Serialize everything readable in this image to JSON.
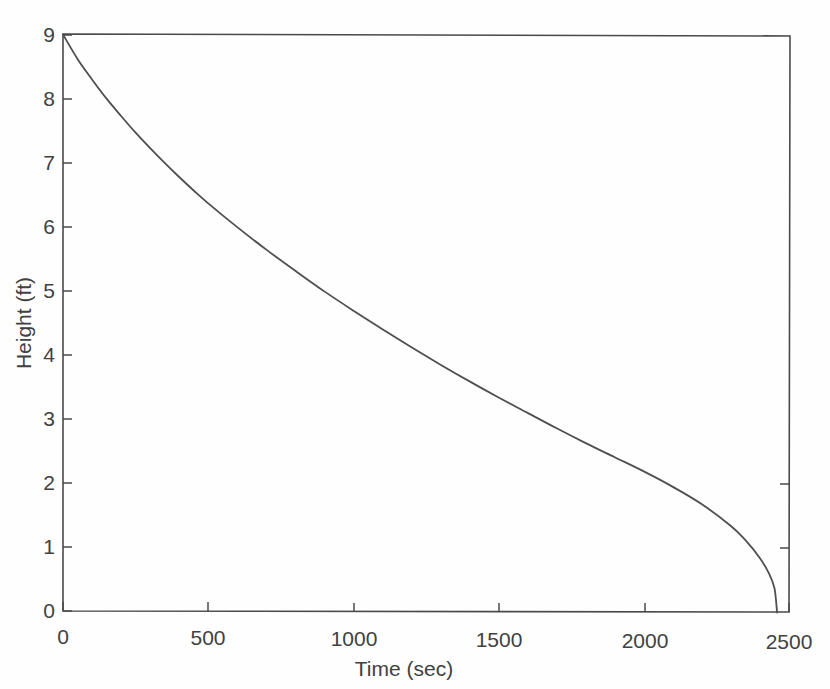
{
  "figure": {
    "background_color": "#fefefe",
    "line_color": "#4f4f4f",
    "axis_color": "#4a4a4a",
    "text_color": "#414141"
  },
  "chart_data": {
    "type": "line",
    "title": "",
    "subtitle": "",
    "xlabel": "Time (sec)",
    "ylabel": "Height (ft)",
    "xlim": [
      0,
      2500
    ],
    "ylim": [
      0,
      9
    ],
    "xticks": [
      0,
      500,
      1000,
      1500,
      2000,
      2500
    ],
    "xtick_labels": [
      "0",
      "500",
      "1000",
      "1500",
      "2000",
      "2500"
    ],
    "yticks": [
      0,
      1,
      2,
      3,
      4,
      5,
      6,
      7,
      8,
      9
    ],
    "ytick_labels": [
      "0",
      "1",
      "2",
      "3",
      "4",
      "5",
      "6",
      "7",
      "8",
      "9"
    ],
    "grid": false,
    "legend": false,
    "legend_position": "none",
    "series": [
      {
        "name": "Tank height",
        "x": [
          0,
          50,
          100,
          150,
          200,
          250,
          300,
          350,
          400,
          450,
          500,
          600,
          700,
          800,
          900,
          1000,
          1100,
          1200,
          1300,
          1400,
          1500,
          1600,
          1700,
          1800,
          1900,
          2000,
          2100,
          2200,
          2300,
          2350,
          2400,
          2430,
          2450,
          2459
        ],
        "y": [
          9.0,
          8.62,
          8.3,
          8.0,
          7.73,
          7.47,
          7.23,
          7.0,
          6.78,
          6.57,
          6.37,
          6.0,
          5.65,
          5.32,
          5.0,
          4.7,
          4.41,
          4.13,
          3.86,
          3.6,
          3.35,
          3.11,
          2.87,
          2.64,
          2.42,
          2.2,
          1.96,
          1.69,
          1.35,
          1.13,
          0.85,
          0.62,
          0.38,
          0.0
        ]
      }
    ],
    "annotations": []
  },
  "caption": {
    "partial_text": ""
  }
}
